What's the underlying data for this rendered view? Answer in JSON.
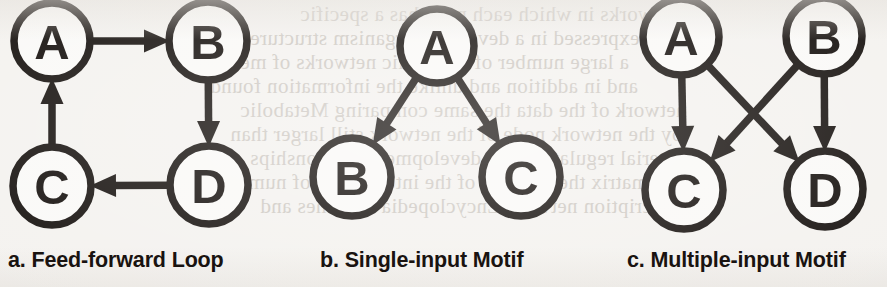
{
  "figure": {
    "background_color": "#f4f2ef",
    "ink_color": "#17120f",
    "node_fill": "#faf9f7",
    "panels": [
      {
        "id": "a",
        "caption": "a. Feed-forward Loop",
        "caption_x": 8,
        "caption_y": 248,
        "nodes": [
          {
            "id": "A",
            "label": "A",
            "cx": 52,
            "cy": 41,
            "r": 38
          },
          {
            "id": "B",
            "label": "B",
            "cx": 208,
            "cy": 41,
            "r": 39
          },
          {
            "id": "C",
            "label": "C",
            "cx": 52,
            "cy": 186,
            "r": 39
          },
          {
            "id": "D",
            "label": "D",
            "cx": 209,
            "cy": 185,
            "r": 39
          }
        ],
        "edges": [
          {
            "from": "A",
            "to": "B"
          },
          {
            "from": "B",
            "to": "D"
          },
          {
            "from": "D",
            "to": "C"
          },
          {
            "from": "C",
            "to": "A"
          }
        ]
      },
      {
        "id": "b",
        "caption": "b. Single-input Motif",
        "caption_x": 320,
        "caption_y": 248,
        "nodes": [
          {
            "id": "A",
            "label": "A",
            "cx": 437,
            "cy": 46,
            "r": 37
          },
          {
            "id": "B",
            "label": "B",
            "cx": 352,
            "cy": 177,
            "r": 39
          },
          {
            "id": "C",
            "label": "C",
            "cx": 521,
            "cy": 177,
            "r": 39
          }
        ],
        "edges": [
          {
            "from": "A",
            "to": "B"
          },
          {
            "from": "A",
            "to": "C"
          }
        ]
      },
      {
        "id": "c",
        "caption": "c. Multiple-input Motif",
        "caption_x": 627,
        "caption_y": 248,
        "nodes": [
          {
            "id": "A",
            "label": "A",
            "cx": 681,
            "cy": 37,
            "r": 38
          },
          {
            "id": "B",
            "label": "B",
            "cx": 824,
            "cy": 36,
            "r": 38
          },
          {
            "id": "C",
            "label": "C",
            "cx": 684,
            "cy": 190,
            "r": 39
          },
          {
            "id": "D",
            "label": "D",
            "cx": 825,
            "cy": 189,
            "r": 38
          }
        ],
        "edges": [
          {
            "from": "A",
            "to": "C"
          },
          {
            "from": "A",
            "to": "D"
          },
          {
            "from": "B",
            "to": "C"
          },
          {
            "from": "B",
            "to": "D"
          }
        ]
      }
    ]
  },
  "background_ghost_text": {
    "description": "faint mirrored show-through text from the reverse side of the scanned page",
    "lines": [
      {
        "text": "networks in which each node has a specific",
        "x": 300,
        "y": 2
      },
      {
        "text": "expressed in a developed organism structure",
        "x": 250,
        "y": 26
      },
      {
        "text": "a large number of metabolic networks of metabolic",
        "x": 180,
        "y": 50
      },
      {
        "text": "and in addition and unlike the information found",
        "x": 210,
        "y": 74
      },
      {
        "text": "network of the data the same comparing Metabolic",
        "x": 240,
        "y": 98
      },
      {
        "text": "by the network node of the network still larger than",
        "x": 230,
        "y": 122
      },
      {
        "text": "material regulatory and development relationships",
        "x": 250,
        "y": 146
      },
      {
        "text": "a matrix the network of the interactions of number",
        "x": 220,
        "y": 170
      },
      {
        "text": "of transcription network Encyclopedia of Genes and",
        "x": 260,
        "y": 194
      }
    ]
  }
}
